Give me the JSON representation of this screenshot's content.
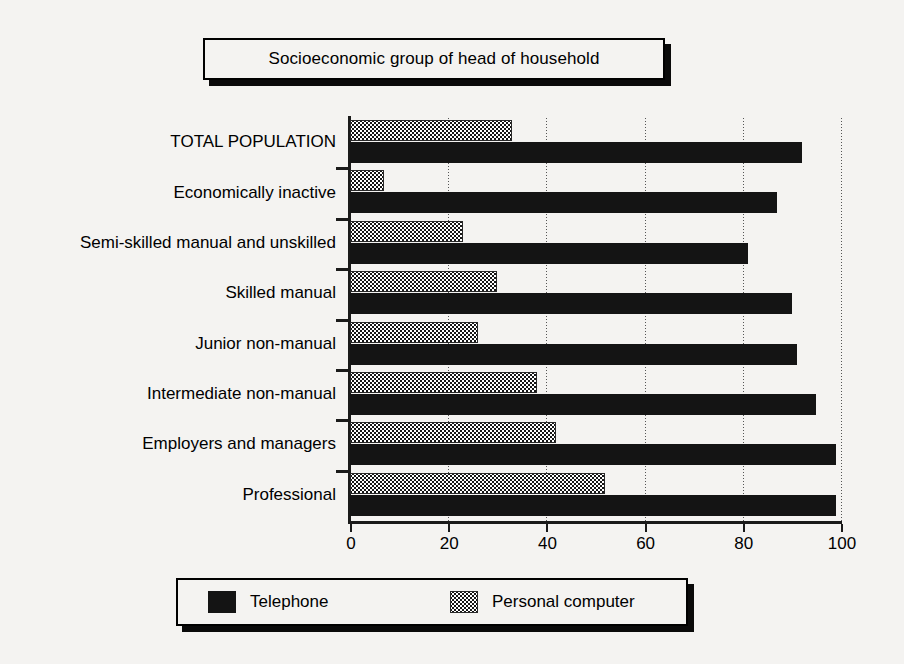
{
  "chart_data": {
    "type": "bar",
    "orientation": "horizontal",
    "title": "Socioeconomic group of head of household",
    "xlabel": "",
    "ylabel": "",
    "xlim": [
      0,
      100
    ],
    "xticks": [
      0,
      20,
      40,
      60,
      80,
      100
    ],
    "xtick_labels": [
      "0",
      "20",
      "40",
      "60",
      "80",
      "100"
    ],
    "grid": "vertical-dotted",
    "legend_position": "bottom",
    "categories": [
      "TOTAL POPULATION",
      "Economically inactive",
      "Semi-skilled manual and unskilled",
      "Skilled manual",
      "Junior non-manual",
      "Intermediate non-manual",
      "Employers and managers",
      "Professional"
    ],
    "series": [
      {
        "name": "Telephone",
        "swatch": "solid-black-swatch",
        "color": "#141414",
        "values": [
          92,
          87,
          81,
          90,
          91,
          95,
          99,
          99
        ]
      },
      {
        "name": "Personal computer",
        "swatch": "checkered-gray-swatch",
        "color": "#808080",
        "values": [
          33,
          7,
          23,
          30,
          26,
          38,
          42,
          52
        ]
      }
    ]
  },
  "legend": {
    "items": [
      {
        "label": "Telephone",
        "swatch": "solid-black-swatch"
      },
      {
        "label": "Personal computer",
        "swatch": "checkered-gray-swatch"
      }
    ]
  }
}
